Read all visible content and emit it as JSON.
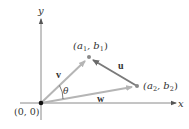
{
  "diagram": {
    "axes": {
      "x_label": "x",
      "y_label": "y",
      "color": "#8a8a8a"
    },
    "origin": {
      "label": "(0, 0)",
      "px": [
        41,
        103
      ],
      "color": "#111111"
    },
    "points": [
      {
        "id": "p1",
        "label_main": "(a",
        "sub1": "1",
        "mid": ", b",
        "sub2": "1",
        "end": ")",
        "px": [
          89,
          57
        ]
      },
      {
        "id": "p2",
        "label_main": "(a",
        "sub1": "2",
        "mid": ", b",
        "sub2": "2",
        "end": ")",
        "px": [
          137,
          86
        ]
      }
    ],
    "vectors": [
      {
        "name": "v",
        "from": "origin",
        "to": "p1",
        "color": "#b5b5b5"
      },
      {
        "name": "w",
        "from": "origin",
        "to": "p2",
        "color": "#b5b5b5"
      },
      {
        "name": "u",
        "from": "p2",
        "to": "p1",
        "color": "#7a7a7a"
      }
    ],
    "angle_label": "θ",
    "colors": {
      "point": "#8a8a8a",
      "text": "#333333"
    }
  }
}
